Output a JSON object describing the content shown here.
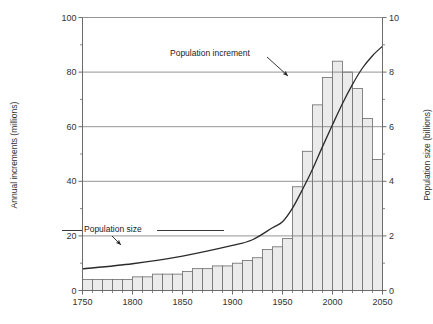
{
  "chart_data": {
    "type": "bar",
    "title": "",
    "xlabel": "",
    "ylabel": "Annual increments (millions)",
    "y2label": "Population size (billions)",
    "xlim": [
      1750,
      2050
    ],
    "ylim": [
      0,
      100
    ],
    "y2lim": [
      0,
      10
    ],
    "yticks": [
      0,
      20,
      40,
      60,
      80,
      100
    ],
    "ytick_labels": [
      "0",
      "20",
      "40",
      "60",
      "80",
      "100"
    ],
    "y2ticks": [
      0,
      2,
      4,
      6,
      8,
      10
    ],
    "y2tick_labels": [
      "0",
      "2",
      "4",
      "6",
      "8",
      "10"
    ],
    "yminor": [
      10,
      30,
      50,
      70,
      90
    ],
    "y2minor": [
      1,
      3,
      5,
      7,
      9
    ],
    "xticks": [
      1750,
      1800,
      1850,
      1900,
      1950,
      2000,
      2050
    ],
    "xtick_labels": [
      "1750",
      "1800",
      "1850",
      "1900",
      "1950",
      "2000",
      "2050"
    ],
    "grid": "horizontal-major-only",
    "legend": "none",
    "bar_fill": "#ebebeb",
    "bar_stroke": "#6b6b6b",
    "line_color": "#2a2a2a",
    "axis_color": "#6b6b6b",
    "categories": [
      1750,
      1760,
      1770,
      1780,
      1790,
      1800,
      1810,
      1820,
      1830,
      1840,
      1850,
      1860,
      1870,
      1880,
      1890,
      1900,
      1910,
      1920,
      1930,
      1940,
      1950,
      1960,
      1970,
      1980,
      1990,
      2000,
      2010,
      2020,
      2030,
      2040
    ],
    "series": [
      {
        "name": "Population increment",
        "unit": "millions per year",
        "axis": "left",
        "type": "bar",
        "values": [
          4,
          4,
          4,
          4,
          4,
          5,
          5,
          6,
          6,
          6,
          7,
          8,
          8,
          9,
          9,
          10,
          11,
          12,
          15,
          16,
          19,
          38,
          51,
          68,
          78,
          84,
          80,
          74,
          63,
          48
        ]
      },
      {
        "name": "Population size",
        "unit": "billions",
        "axis": "right",
        "type": "line",
        "x": [
          1750,
          1800,
          1850,
          1900,
          1920,
          1940,
          1950,
          1960,
          1970,
          1980,
          1990,
          2000,
          2010,
          2020,
          2030,
          2040,
          2050
        ],
        "values": [
          0.79,
          0.98,
          1.26,
          1.65,
          1.86,
          2.3,
          2.52,
          3.02,
          3.7,
          4.44,
          5.27,
          6.07,
          6.85,
          7.55,
          8.15,
          8.6,
          8.95
        ]
      }
    ],
    "annotations": [
      {
        "text": "Population increment",
        "target_x": 1990,
        "target_y": 80
      },
      {
        "text": "Population size",
        "target_x": 1880,
        "target_y": 1.5
      }
    ]
  },
  "axes": {
    "left_title": "Annual increments (millions)",
    "right_title": "Population size (billions)"
  },
  "annotations": {
    "increment_label": "Population increment",
    "size_label": "Population size"
  }
}
